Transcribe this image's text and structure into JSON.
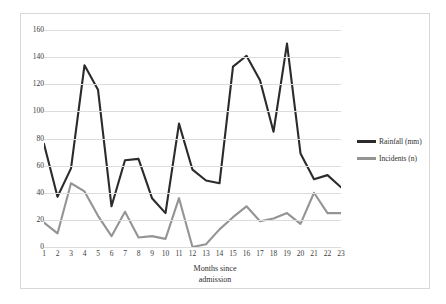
{
  "chart_data": {
    "type": "line",
    "title": "",
    "xlabel": "Months since admission",
    "ylabel": "",
    "xlim": [
      1,
      23
    ],
    "ylim": [
      0,
      160
    ],
    "ytick_step": 20,
    "grid": true,
    "legend_position": "right",
    "categories": [
      1,
      2,
      3,
      4,
      5,
      6,
      7,
      8,
      9,
      10,
      11,
      12,
      13,
      14,
      15,
      16,
      17,
      18,
      19,
      20,
      21,
      22,
      23
    ],
    "xtick_labels": [
      "1",
      "2",
      "3",
      "4",
      "5",
      "6",
      "7",
      "8",
      "9",
      "10",
      "11",
      "12",
      "13",
      "14",
      "15",
      "16",
      "17",
      "18",
      "19",
      "20",
      "21",
      "22",
      "23"
    ],
    "ytick_labels": [
      "0",
      "20",
      "40",
      "60",
      "80",
      "100",
      "120",
      "140",
      "160"
    ],
    "series": [
      {
        "name": "Rainfall (mm)",
        "color": "#2b2b2b",
        "values": [
          76,
          37,
          58,
          134,
          116,
          30,
          64,
          65,
          36,
          25,
          91,
          57,
          49,
          47,
          133,
          141,
          123,
          85,
          150,
          69,
          50,
          53,
          44
        ]
      },
      {
        "name": "Incidents (n)",
        "color": "#949494",
        "values": [
          18,
          10,
          47,
          41,
          23,
          8,
          26,
          7,
          8,
          6,
          36,
          0,
          2,
          13,
          22,
          30,
          19,
          21,
          25,
          17,
          40,
          25,
          25
        ]
      }
    ]
  },
  "legend": {
    "items": [
      {
        "label": "Rainfall (mm)",
        "color": "#2b2b2b"
      },
      {
        "label": "Incidents (n)",
        "color": "#949494"
      }
    ]
  },
  "axis": {
    "x_title_line1": "Months since",
    "x_title_line2": "admission"
  }
}
